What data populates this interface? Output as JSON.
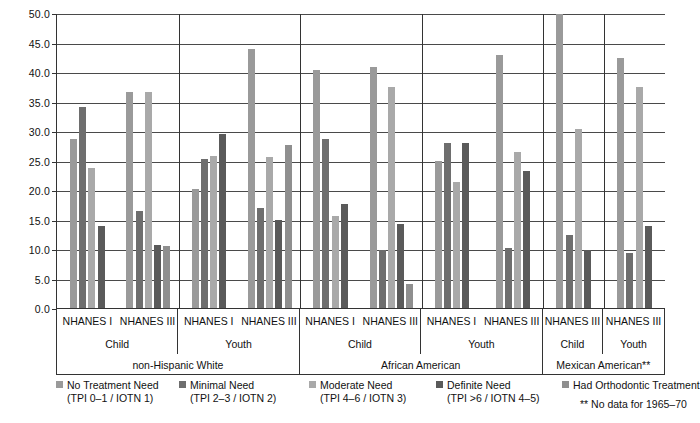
{
  "chart_data": {
    "type": "bar",
    "title": "",
    "xlabel": "",
    "ylabel": "",
    "ylim": [
      0,
      50
    ],
    "grid": true,
    "legend_position": "bottom",
    "ytick_labels": [
      "50.0",
      "45.0",
      "40.0",
      "35.0",
      "30.0",
      "25.0",
      "20.0",
      "15.0",
      "10.0",
      "5.0",
      "0.0"
    ],
    "ytick_values": [
      50,
      45,
      40,
      35,
      30,
      25,
      20,
      15,
      10,
      5,
      0
    ],
    "categories": [
      "non-Hispanic White / Child / NHANES I",
      "non-Hispanic White / Child / NHANES III",
      "non-Hispanic White / Youth / NHANES I",
      "non-Hispanic White / Youth / NHANES III",
      "African American / Child / NHANES I",
      "African American / Child / NHANES III",
      "African American / Youth / NHANES I",
      "African American / Youth / NHANES III",
      "Mexican American / Child / NHANES III",
      "Mexican American / Youth / NHANES III"
    ],
    "series": [
      {
        "name": "No Treatment Need",
        "color": "#9a9a9a",
        "values": [
          28.7,
          36.6,
          20.2,
          43.9,
          40.3,
          40.8,
          24.9,
          42.8,
          49.9,
          42.3
        ]
      },
      {
        "name": "Minimal Need",
        "color": "#6e6e6e",
        "values": [
          34.1,
          16.5,
          25.3,
          17.0,
          28.7,
          9.8,
          27.9,
          10.1,
          12.4,
          9.4
        ]
      },
      {
        "name": "Moderate Need",
        "color": "#a9a9a9",
        "values": [
          23.8,
          36.6,
          25.7,
          25.6,
          15.6,
          37.5,
          21.4,
          26.4,
          30.4,
          37.4
        ]
      },
      {
        "name": "Definite Need",
        "color": "#5a5a5a",
        "values": [
          13.9,
          10.7,
          29.5,
          15.0,
          17.6,
          14.2,
          27.9,
          23.2,
          9.8,
          13.9
        ]
      },
      {
        "name": "Had Orthodontic Treatment",
        "color": "#8f8f8f",
        "values": [
          null,
          10.5,
          null,
          27.7,
          null,
          4.1,
          null,
          null,
          null,
          null
        ]
      }
    ]
  },
  "axis": {
    "groups_row": [
      "NHANES I",
      "NHANES III",
      "NHANES I",
      "NHANES III",
      "NHANES I",
      "NHANES III",
      "NHANES I",
      "NHANES III",
      "NHANES III",
      "NHANES III"
    ],
    "age_row": [
      "Child",
      "Youth",
      "Child",
      "Youth",
      "Child",
      "Youth"
    ],
    "age_row_labels": [
      "Child",
      "Youth",
      "Child",
      "Youth",
      "Child",
      "Youth"
    ],
    "race_row": [
      "non-Hispanic White",
      "African American",
      "Mexican American**"
    ]
  },
  "legend": {
    "items": [
      {
        "label": "No Treatment Need",
        "sub": "(TPI 0–1 / IOTN 1)",
        "color": "#9a9a9a"
      },
      {
        "label": "Minimal Need",
        "sub": "(TPI 2–3 / IOTN 2)",
        "color": "#6e6e6e"
      },
      {
        "label": "Moderate Need",
        "sub": "(TPI 4–6 / IOTN 3)",
        "color": "#a9a9a9"
      },
      {
        "label": "Definite Need",
        "sub": "(TPI >6 / IOTN 4–5)",
        "color": "#5a5a5a"
      },
      {
        "label": "Had Orthodontic Treatment",
        "sub": "",
        "color": "#8f8f8f"
      }
    ],
    "footnote": "** No data for 1965–70"
  }
}
